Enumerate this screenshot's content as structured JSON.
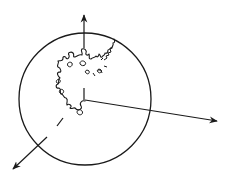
{
  "diagram": {
    "colors": {
      "stroke": "#1a1a1a",
      "background": "#ffffff"
    },
    "sphere": {
      "cx": 85,
      "cy": 99,
      "r": 66
    },
    "origin": {
      "x": 85,
      "y": 100
    },
    "axes": [
      {
        "name": "z-axis-up",
        "tip": [
          84,
          14
        ]
      },
      {
        "name": "x-axis-right",
        "tip": [
          218,
          121
        ]
      },
      {
        "name": "y-axis-down-left",
        "tip": [
          12,
          170
        ]
      }
    ],
    "labels": []
  }
}
